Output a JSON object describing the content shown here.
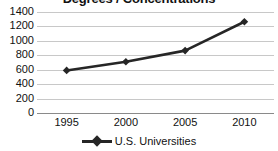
{
  "chart_data": {
    "type": "line",
    "title": "Degrees / Concentrations",
    "xlabel": "",
    "ylabel": "",
    "categories": [
      "1995",
      "2000",
      "2005",
      "2010"
    ],
    "x": [
      1995,
      2000,
      2005,
      2010
    ],
    "series": [
      {
        "name": "U.S. Universities",
        "values": [
          590,
          710,
          865,
          1265
        ],
        "color": "#262626",
        "marker": "diamond"
      }
    ],
    "ylim": [
      0,
      1400
    ],
    "yticks": [
      0,
      200,
      400,
      600,
      800,
      1000,
      1200,
      1400
    ],
    "ytick_labels": [
      "0",
      "200",
      "400",
      "600",
      "800",
      "1000",
      "1200",
      "1400"
    ],
    "xtick_labels": [
      "1995",
      "2000",
      "2005",
      "2010"
    ],
    "grid": true,
    "grid_axis": "y",
    "grid_color": "#c8c8c8",
    "axis_color": "#8a8a8a",
    "legend_position": "bottom",
    "legend_entries": [
      "U.S. Universities"
    ],
    "background": "#ffffff",
    "title_clipped": true
  }
}
